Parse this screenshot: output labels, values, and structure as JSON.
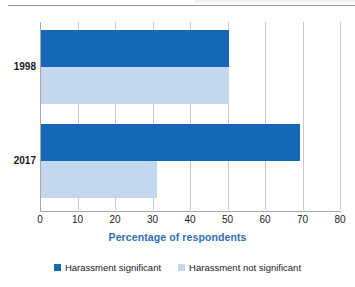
{
  "chart_data": {
    "type": "bar",
    "orientation": "horizontal",
    "title": "",
    "subtitle": "",
    "categories": [
      "1998",
      "2017"
    ],
    "series": [
      {
        "name": "Harassment significant",
        "values": [
          50,
          69
        ],
        "color": "#1568b8"
      },
      {
        "name": "Harassment not significant",
        "values": [
          50,
          31
        ],
        "color": "#c3d8ee"
      }
    ],
    "xlabel": "Percentage of respondents",
    "ylabel": "",
    "xlim": [
      0,
      80
    ],
    "xticks": [
      0,
      10,
      20,
      30,
      40,
      50,
      60,
      70,
      80
    ],
    "xtick_labels": [
      "0",
      "10",
      "20",
      "30",
      "40",
      "50",
      "60",
      "70",
      "80"
    ],
    "grid": "vertical",
    "legend_position": "bottom-center"
  },
  "axis": {
    "xlabel": "Percentage of respondents",
    "ticks": [
      {
        "value": 0,
        "label": "0"
      },
      {
        "value": 10,
        "label": "10"
      },
      {
        "value": 20,
        "label": "20"
      },
      {
        "value": 30,
        "label": "30"
      },
      {
        "value": 40,
        "label": "40"
      },
      {
        "value": 50,
        "label": "50"
      },
      {
        "value": 60,
        "label": "60"
      },
      {
        "value": 70,
        "label": "70"
      },
      {
        "value": 80,
        "label": "80"
      }
    ],
    "categories": [
      {
        "label": "1998"
      },
      {
        "label": "2017"
      }
    ]
  },
  "legend": {
    "items": [
      {
        "label": "Harassment significant",
        "color": "#1568b8"
      },
      {
        "label": "Harassment not significant",
        "color": "#c3d8ee"
      }
    ]
  },
  "colors": {
    "series_dark": "#1568b8",
    "series_light": "#c3d8ee",
    "axis_label": "#2e6db4",
    "gridline": "#c9c9c9",
    "axis_line": "#a8a8a8",
    "text": "#1a1a1a"
  }
}
